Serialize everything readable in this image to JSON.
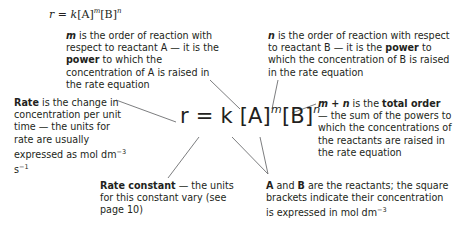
{
  "top_equation": {
    "r": "r",
    "eq": " = ",
    "k": "k",
    "A": "[A]",
    "m": "m",
    "B": "[B]",
    "n": "n"
  },
  "main_equation": {
    "lhs": "r = ",
    "k": "k",
    "A": " [A]",
    "m": "m",
    "B": "[B]",
    "n": "n"
  },
  "annotations": {
    "m_order": {
      "term": "m",
      "text1": " is the order of reaction with respect to reactant A — it is the ",
      "bold": "power",
      "text2": " to which the concentration of A is raised in the rate equation"
    },
    "n_order": {
      "term": "n",
      "text1": " is the order of reaction with respect to reactant B — it is the ",
      "bold": "power",
      "text2": " to which the concentration of B is raised in the rate equation"
    },
    "rate": {
      "bold": "Rate",
      "text": " is the change in concentration per unit time — the units for rate are usually expressed as ",
      "units": "mol dm",
      "exp1": "−3",
      "units2": " s",
      "exp2": "−1"
    },
    "total_order": {
      "term": "m + n",
      "text1": " is the ",
      "bold": "total order",
      "text2": " — the sum of the powers to which the concentrations of the reactants are raised in the rate equation"
    },
    "rate_constant": {
      "bold": "Rate constant",
      "text": " — the units for this constant vary (see page 10)"
    },
    "reactants": {
      "A": "A",
      "and": " and ",
      "B": "B",
      "text": " are the reactants; the square brackets indicate their concentration is expressed in mol dm",
      "exp": "−3"
    }
  }
}
